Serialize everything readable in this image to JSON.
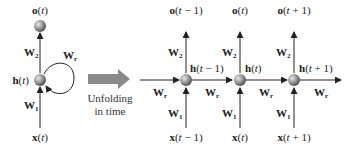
{
  "folded": {
    "output": "o(t)",
    "hidden": "h(t)",
    "input": "x(t)",
    "w_out": "W2",
    "w_in": "W1",
    "w_rec": "Wr"
  },
  "transition": {
    "caption_line1": "Unfolding",
    "caption_line2": "in time",
    "arrow_color": "#8a8a8a"
  },
  "unfolded": {
    "steps": [
      {
        "output": "o(t − 1)",
        "hidden": "h(t − 1)",
        "input": "x(t − 1)"
      },
      {
        "output": "o(t)",
        "hidden": "h(t)",
        "input": "x(t)"
      },
      {
        "output": "o(t + 1)",
        "hidden": "h(t + 1)",
        "input": "x(t + 1)"
      }
    ],
    "w_out": "W2",
    "w_in": "W1",
    "w_rec": "Wr"
  },
  "node_color": "#8c8c8c"
}
